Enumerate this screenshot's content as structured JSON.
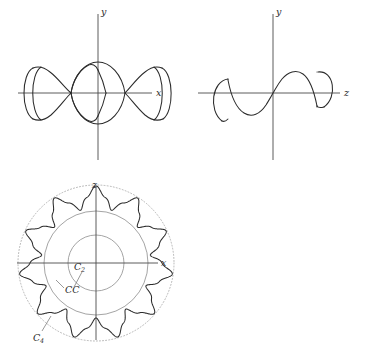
{
  "figure": {
    "background_color": "#ffffff",
    "curve_color": "#2b2b2b",
    "axis_color": "#4a4a4a",
    "reference_circle_color": "#8d8d8d",
    "dotted_circle_color": "#a9a9a9"
  },
  "panels": {
    "xy_projection": {
      "name": "xy-plane projection",
      "horizontal_axis_label": "x",
      "vertical_axis_label": "y",
      "origin": {
        "x": 98,
        "y": 93
      },
      "axis_extent": {
        "x_min": 18,
        "x_max": 152,
        "y_min": 14,
        "y_max": 160
      }
    },
    "zy_projection": {
      "name": "zy-plane projection",
      "horizontal_axis_label": "z",
      "vertical_axis_label": "y",
      "origin": {
        "x": 273,
        "y": 93
      },
      "axis_extent": {
        "x_min": 198,
        "x_max": 340,
        "y_min": 14,
        "y_max": 160
      }
    },
    "xz_projection": {
      "name": "xz-plane projection",
      "horizontal_axis_label": "x",
      "vertical_axis_label": "z",
      "origin": {
        "x": 96,
        "y": 263
      },
      "axis_extent": {
        "x_min": 17,
        "x_max": 158,
        "y_min": 186,
        "y_max": 340
      },
      "labels": [
        {
          "id": "c2",
          "text": "C",
          "subscript": "2",
          "x": 77,
          "y": 268
        },
        {
          "id": "cc",
          "text": "CC",
          "subscript": "",
          "x": 66,
          "y": 291
        },
        {
          "id": "c4",
          "text": "C",
          "subscript": "4",
          "x": 34,
          "y": 339
        }
      ]
    }
  },
  "chart_data": {
    "type": "line",
    "title": "",
    "panels": [
      {
        "id": "xy_projection",
        "xlabel": "x",
        "ylabel": "y",
        "grid": false,
        "legend": null,
        "features": "Chain of four lens/loop lobes along the x-axis with crossing nodes at x = -2, -1, 0, 1, 2 units, plus outward-bulging arc caps closing the curve at both extremities."
      },
      {
        "id": "zy_projection",
        "xlabel": "z",
        "ylabel": "y",
        "grid": false,
        "legend": null,
        "features": "One and a half periods of a sinusoid y = A sin(kz) passing through the origin, terminated at both ends by outward circular arc caps.",
        "x": [
          -3.0,
          -2.5,
          -2.0,
          -1.5,
          -1.0,
          -0.5,
          0.0,
          0.5,
          1.0,
          1.5,
          2.0,
          2.5,
          3.0
        ],
        "y": [
          0.95,
          0.95,
          0.3,
          -0.72,
          -1.0,
          -0.7,
          0.0,
          0.7,
          1.0,
          0.72,
          -0.3,
          -0.95,
          -0.95
        ]
      },
      {
        "id": "xz_projection",
        "xlabel": "x",
        "ylabel": "z",
        "grid": false,
        "legend": null,
        "lobe_count": 11,
        "reference_circles": [
          {
            "label": "C",
            "subscript": "2",
            "radius_px": 28,
            "style": "solid"
          },
          {
            "label": "CC",
            "subscript": "",
            "radius_px": 52,
            "style": "solid"
          },
          {
            "label": "C",
            "subscript": "4",
            "radius_px": 78,
            "style": "dotted"
          }
        ],
        "features": "Eleven-lobed rosette (rose/epitrochoid) oscillating between an inner radius of about 56 px and an outer radius of about 76 px, drawn with three concentric reference circles."
      }
    ]
  }
}
